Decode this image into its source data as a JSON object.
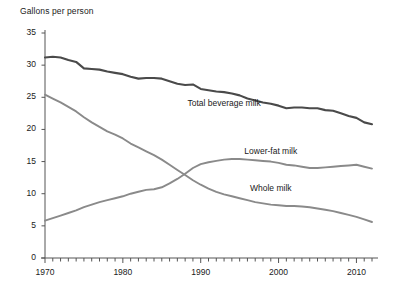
{
  "chart_data": {
    "type": "line",
    "title": "Gallons per person",
    "xlabel": "",
    "ylabel": "Gallons per person",
    "ylim": [
      0,
      35
    ],
    "xlim": [
      1970,
      2012
    ],
    "ytick_values": [
      0,
      5,
      10,
      15,
      20,
      25,
      30,
      35
    ],
    "ytick_labels": [
      "0",
      "5",
      "10",
      "15",
      "20",
      "25",
      "30",
      "35"
    ],
    "xtick_values": [
      1970,
      1980,
      1990,
      2000,
      2010
    ],
    "xtick_labels": [
      "1970",
      "1980",
      "1990",
      "2000",
      "2010"
    ],
    "xtick_minor_step": 1,
    "grid": false,
    "legend_position": "inline-annotations",
    "x": [
      1970,
      1971,
      1972,
      1973,
      1974,
      1975,
      1976,
      1977,
      1978,
      1979,
      1980,
      1981,
      1982,
      1983,
      1984,
      1985,
      1986,
      1987,
      1988,
      1989,
      1990,
      1991,
      1992,
      1993,
      1994,
      1995,
      1996,
      1997,
      1998,
      1999,
      2000,
      2001,
      2002,
      2003,
      2004,
      2005,
      2006,
      2007,
      2008,
      2009,
      2010,
      2011,
      2012
    ],
    "series": [
      {
        "name": "Total beverage milk",
        "color": "#4a4a4a",
        "label_x": 1993,
        "label_y": 24.0,
        "values": [
          31.2,
          31.3,
          31.2,
          30.8,
          30.5,
          29.5,
          29.4,
          29.3,
          29.0,
          28.8,
          28.6,
          28.2,
          27.9,
          28.0,
          28.0,
          27.9,
          27.5,
          27.1,
          26.9,
          27.0,
          26.3,
          26.1,
          25.9,
          25.8,
          25.6,
          25.3,
          24.8,
          24.5,
          24.2,
          24.0,
          23.7,
          23.3,
          23.4,
          23.4,
          23.3,
          23.3,
          23.0,
          22.9,
          22.5,
          22.1,
          21.8,
          21.1,
          20.8
        ]
      },
      {
        "name": "Lower-fat milk",
        "color": "#8a8a8a",
        "label_x": 1999,
        "label_y": 16.5,
        "values": [
          5.8,
          6.2,
          6.6,
          7.0,
          7.4,
          7.9,
          8.3,
          8.7,
          9.0,
          9.3,
          9.6,
          10.0,
          10.3,
          10.6,
          10.7,
          11.0,
          11.6,
          12.3,
          13.1,
          14.0,
          14.6,
          14.9,
          15.1,
          15.3,
          15.4,
          15.4,
          15.3,
          15.2,
          15.1,
          15.0,
          14.8,
          14.5,
          14.4,
          14.2,
          14.0,
          14.0,
          14.1,
          14.2,
          14.3,
          14.4,
          14.5,
          14.2,
          13.9
        ]
      },
      {
        "name": "Whole milk",
        "color": "#8a8a8a",
        "label_x": 1999,
        "label_y": 10.8,
        "values": [
          25.4,
          24.8,
          24.2,
          23.5,
          22.8,
          21.9,
          21.1,
          20.4,
          19.7,
          19.2,
          18.6,
          17.8,
          17.2,
          16.6,
          16.0,
          15.3,
          14.5,
          13.7,
          12.9,
          12.1,
          11.4,
          10.8,
          10.3,
          9.9,
          9.6,
          9.3,
          9.0,
          8.7,
          8.5,
          8.3,
          8.2,
          8.1,
          8.1,
          8.0,
          7.9,
          7.7,
          7.5,
          7.3,
          7.0,
          6.7,
          6.4,
          6.0,
          5.6
        ]
      }
    ]
  }
}
